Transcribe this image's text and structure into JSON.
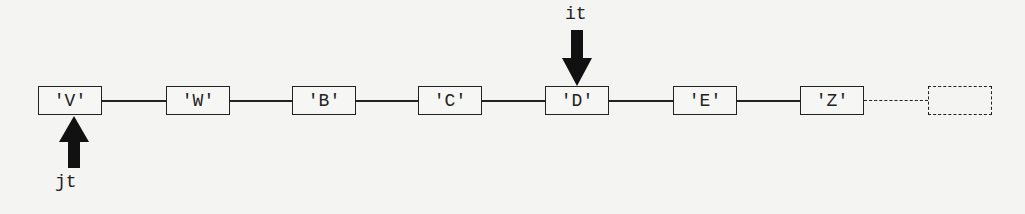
{
  "nodes": [
    {
      "label": "'V'"
    },
    {
      "label": "'W'"
    },
    {
      "label": "'B'"
    },
    {
      "label": "'C'"
    },
    {
      "label": "'D'"
    },
    {
      "label": "'E'"
    },
    {
      "label": "'Z'"
    }
  ],
  "pointers": {
    "it": {
      "label": "it",
      "target_index": 4,
      "direction": "down"
    },
    "jt": {
      "label": "jt",
      "target_index": 0,
      "direction": "up"
    }
  },
  "trailing_node": {
    "style": "dashed",
    "label": ""
  }
}
